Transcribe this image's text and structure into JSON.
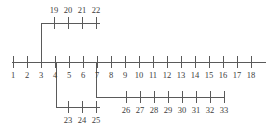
{
  "diagram": {
    "type": "branching-number-line",
    "canvas": {
      "width": 277,
      "height": 136,
      "background": "#ffffff"
    },
    "stroke_color": "#5a5a5a",
    "label_color": "#3d3d3d",
    "axes": [
      {
        "id": "main-axis",
        "name": "main-number-line",
        "orientation": "horizontal",
        "y": 62,
        "x_start": 12,
        "x_end": 266,
        "tick_top": 56,
        "tick_bottom": 68,
        "label_y": 78,
        "tick_spacing": 14,
        "first_tick_x": 13,
        "labels": [
          "1",
          "2",
          "3",
          "4",
          "5",
          "6",
          "7",
          "8",
          "9",
          "10",
          "11",
          "12",
          "13",
          "14",
          "15",
          "16",
          "17",
          "18"
        ]
      },
      {
        "id": "top-branch",
        "name": "upper-branch-line",
        "orientation": "horizontal",
        "y": 23,
        "x_start": 41,
        "x_end": 100,
        "tick_top": 17,
        "tick_bottom": 29,
        "label_y": 13,
        "tick_spacing": 14,
        "first_tick_x": 54,
        "labels": [
          "19",
          "20",
          "21",
          "22"
        ]
      },
      {
        "id": "bottom-left-branch",
        "name": "lower-left-branch-line",
        "orientation": "horizontal",
        "y": 107,
        "x_start": 56,
        "x_end": 100,
        "tick_top": 101,
        "tick_bottom": 113,
        "label_y": 123,
        "tick_spacing": 14,
        "first_tick_x": 68,
        "labels": [
          "23",
          "24",
          "25"
        ]
      },
      {
        "id": "bottom-right-branch",
        "name": "lower-right-branch-line",
        "orientation": "horizontal",
        "y": 97,
        "x_start": 96,
        "x_end": 224,
        "tick_top": 91,
        "tick_bottom": 103,
        "label_y": 113,
        "tick_spacing": 14,
        "first_tick_x": 126,
        "labels": [
          "26",
          "27",
          "28",
          "29",
          "30",
          "31",
          "32",
          "33"
        ]
      }
    ],
    "risers": [
      {
        "id": "riser-top",
        "name": "riser-to-upper-branch",
        "x": 41,
        "y1": 23,
        "y2": 62
      },
      {
        "id": "riser-bottom-left",
        "name": "riser-to-lower-left-branch",
        "x": 56,
        "y1": 62,
        "y2": 107
      },
      {
        "id": "riser-bottom-right",
        "name": "riser-to-lower-right-branch",
        "x": 96,
        "y1": 62,
        "y2": 97
      }
    ]
  }
}
